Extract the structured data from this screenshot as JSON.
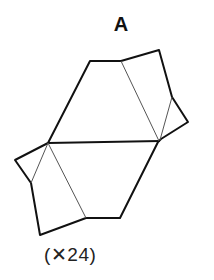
{
  "figure": {
    "label": "A",
    "count_text": "(✕24)",
    "colors": {
      "stroke": "#111111",
      "fold": "#555555",
      "fill": "#ffffff"
    },
    "outline": "15,160 48,143 90,61 121,61 159,50 172,97 188,122 161,139 158,142 120,218 86,218 40,235 31,183",
    "hex_top": "48,143 90,61 121,61 161,141",
    "hex_bottom": "48,143 158,142 120,218 86,218",
    "fold_lines": [
      {
        "x1": 121,
        "y1": 61,
        "x2": 159,
        "y2": 141
      },
      {
        "x1": 172,
        "y1": 97,
        "x2": 160,
        "y2": 140
      },
      {
        "x1": 48,
        "y1": 143,
        "x2": 86,
        "y2": 218
      },
      {
        "x1": 48,
        "y1": 143,
        "x2": 31,
        "y2": 183
      }
    ],
    "center_line": {
      "x1": 48,
      "y1": 143,
      "x2": 160,
      "y2": 141
    }
  }
}
